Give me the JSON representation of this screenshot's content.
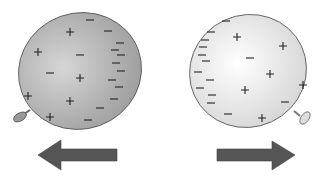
{
  "diagram": {
    "left_balloon": {
      "fill": "#a8a8a8",
      "highlight": "#d8d8d8",
      "plus_signs": [
        [
          70,
          32
        ],
        [
          38,
          52
        ],
        [
          80,
          78
        ],
        [
          28,
          96
        ],
        [
          70,
          101
        ],
        [
          50,
          117
        ]
      ],
      "minus_signs": [
        [
          90,
          20
        ],
        [
          108,
          31
        ],
        [
          50,
          73
        ],
        [
          80,
          55
        ],
        [
          120,
          43
        ],
        [
          115,
          50
        ],
        [
          121,
          55
        ],
        [
          116,
          63
        ],
        [
          121,
          71
        ],
        [
          112,
          80
        ],
        [
          119,
          87
        ],
        [
          114,
          99
        ],
        [
          100,
          108
        ],
        [
          88,
          120
        ]
      ]
    },
    "right_balloon": {
      "fill": "#e6e6e6",
      "highlight": "#ffffff",
      "plus_signs": [
        [
          237,
          37
        ],
        [
          283,
          46
        ],
        [
          270,
          74
        ],
        [
          245,
          90
        ],
        [
          303,
          85
        ],
        [
          262,
          118
        ]
      ],
      "minus_signs": [
        [
          226,
          21
        ],
        [
          211,
          32
        ],
        [
          205,
          40
        ],
        [
          203,
          47
        ],
        [
          202,
          55
        ],
        [
          206,
          61
        ],
        [
          198,
          72
        ],
        [
          210,
          80
        ],
        [
          200,
          88
        ],
        [
          212,
          95
        ],
        [
          211,
          103
        ],
        [
          250,
          58
        ],
        [
          285,
          102
        ],
        [
          228,
          114
        ]
      ]
    },
    "arrows": {
      "color": "#555555",
      "left": {
        "direction": "left",
        "label": "force-left"
      },
      "right": {
        "direction": "right",
        "label": "force-right"
      }
    },
    "signs": {
      "plus": "+",
      "minus": "−"
    }
  }
}
